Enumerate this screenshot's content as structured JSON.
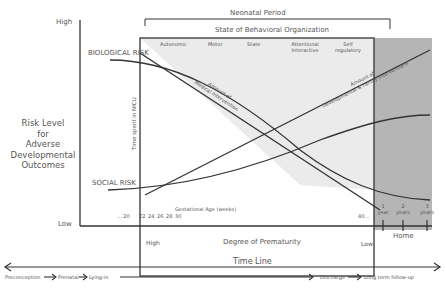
{
  "y_axis": {
    "high_label": "High",
    "low_label": "Low",
    "title_lines": [
      "Risk Level",
      "for",
      "Adverse",
      "Developmental",
      "Outcomes"
    ]
  },
  "header": {
    "neonatal_period": "Neonatal Period",
    "behavioral_org": "State of Behavioral Organization",
    "stages": [
      "Autonomic",
      "Motor",
      "State",
      "Attentional\nInteractive",
      "Self\nregulatory"
    ]
  },
  "curves": {
    "biological_risk": "BIOLOGICAL RISK",
    "social_risk": "SOCIAL RISK",
    "medical_intervention": "Amount of\nMedical Intervention",
    "developmental_intervention": "Amount of\nDevelopmental & Family Interventions",
    "time_in_nicu": "Time spent in NICU"
  },
  "gestational_age": {
    "label": "Gestational Age (weeks)",
    "ticks": [
      "... 20",
      "22",
      "24",
      "26",
      "28",
      "30"
    ],
    "end_tick": "40..."
  },
  "followup": {
    "ticks": [
      {
        "num": "1",
        "unit": "year"
      },
      {
        "num": "2",
        "unit": "years"
      },
      {
        "num": "3",
        "unit": "years"
      }
    ],
    "home_label": "Home"
  },
  "prematurity": {
    "high": "High",
    "title": "Degree of Prematurity",
    "low": "Low"
  },
  "timeline": {
    "title": "Time Line",
    "stages": [
      "Preconception",
      "Prenatal",
      "Lying-in",
      "Discharge",
      "Long term follow-up"
    ]
  },
  "colors": {
    "nicu_fill": "#ebebeb",
    "home_fill": "#b5b5b5",
    "line": "#333333",
    "text": "#555555"
  }
}
